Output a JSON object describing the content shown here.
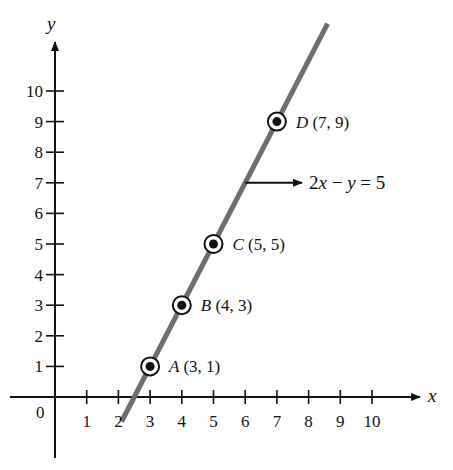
{
  "chart_data": {
    "type": "line",
    "title": "",
    "xlabel": "x",
    "ylabel": "y",
    "xlim": [
      0,
      10
    ],
    "ylim": [
      0,
      10
    ],
    "grid": false,
    "origin_label": "0",
    "x_ticks": [
      "1",
      "2",
      "3",
      "4",
      "5",
      "6",
      "7",
      "8",
      "9",
      "10"
    ],
    "y_ticks": [
      "1",
      "2",
      "3",
      "4",
      "5",
      "6",
      "7",
      "8",
      "9",
      "10"
    ],
    "line": {
      "equation": "2x − y = 5",
      "slope": 2,
      "intercept": -5,
      "x_range": [
        2.1,
        8.6
      ],
      "color": "#6e6e6e"
    },
    "points": [
      {
        "name": "A",
        "coords": "(3, 1)",
        "x": 3,
        "y": 1
      },
      {
        "name": "B",
        "coords": "(4, 3)",
        "x": 4,
        "y": 3
      },
      {
        "name": "C",
        "coords": "(5, 5)",
        "x": 5,
        "y": 5
      },
      {
        "name": "D",
        "coords": "(7, 9)",
        "x": 7,
        "y": 9
      }
    ],
    "annotation": {
      "text": "2x − y = 5",
      "arrow_from_x": 6,
      "arrow_y": 7
    }
  }
}
